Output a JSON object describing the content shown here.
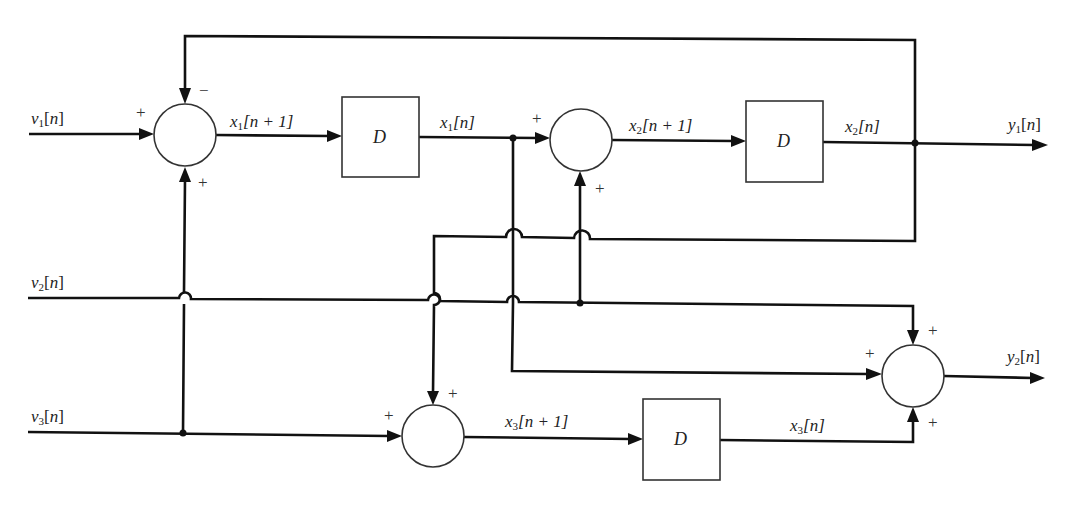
{
  "diagram": {
    "type": "block-diagram",
    "inputs": [
      {
        "id": "v1",
        "label": "v1[n]",
        "base": "v",
        "sub": "1"
      },
      {
        "id": "v2",
        "label": "v2[n]",
        "base": "v",
        "sub": "2"
      },
      {
        "id": "v3",
        "label": "v3[n]",
        "base": "v",
        "sub": "3"
      }
    ],
    "outputs": [
      {
        "id": "y1",
        "label": "y1[n]",
        "base": "y",
        "sub": "1"
      },
      {
        "id": "y2",
        "label": "y2[n]",
        "base": "y",
        "sub": "2"
      }
    ],
    "delays": [
      {
        "id": "D1",
        "label": "D"
      },
      {
        "id": "D2",
        "label": "D"
      },
      {
        "id": "D3",
        "label": "D"
      }
    ],
    "signals": {
      "x1_next": {
        "base": "x",
        "sub": "1",
        "arg": "[n + 1]"
      },
      "x1": {
        "base": "x",
        "sub": "1",
        "arg": "[n]"
      },
      "x2_next": {
        "base": "x",
        "sub": "2",
        "arg": "[n + 1]"
      },
      "x2": {
        "base": "x",
        "sub": "2",
        "arg": "[n]"
      },
      "x3_next": {
        "base": "x",
        "sub": "3",
        "arg": "[n + 1]"
      },
      "x3": {
        "base": "x",
        "sub": "3",
        "arg": "[n]"
      },
      "v_arg": "[n]",
      "y_arg": "[n]"
    },
    "summing_junctions": [
      {
        "id": "sum1",
        "signs": {
          "left": "+",
          "top": "−",
          "bottom": "+"
        }
      },
      {
        "id": "sum2",
        "signs": {
          "left": "+",
          "bottom": "+"
        }
      },
      {
        "id": "sum3",
        "signs": {
          "left": "+",
          "top": "+"
        }
      },
      {
        "id": "sum4",
        "signs": {
          "left": "+",
          "top": "+",
          "bottom": "+"
        }
      }
    ],
    "edges": [
      "v1 -> sum1(+)",
      "y1/x2 -> sum1(−) feedback",
      "v3 -> sum1(+)",
      "sum1 -> D1 (x1[n+1])",
      "D1 -> sum2(+) (x1[n])",
      "v2 -> sum2(+)",
      "sum2 -> D2 (x2[n+1])",
      "D2 -> y1 (x2[n])",
      "x2 -> sum3(+)",
      "v3 -> sum3(+)",
      "sum3 -> D3 (x3[n+1])",
      "v2 -> sum4(+)",
      "x1 -> sum4(+)",
      "D3 -> sum4(+) (x3[n])",
      "sum4 -> y2"
    ]
  }
}
